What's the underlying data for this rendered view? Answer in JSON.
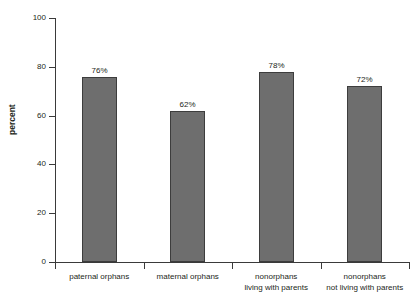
{
  "chart_data": {
    "type": "bar",
    "title": "",
    "xlabel": "",
    "ylabel": "percent",
    "ylim": [
      0,
      100
    ],
    "yticks": [
      0,
      20,
      40,
      60,
      80,
      100
    ],
    "grid": false,
    "legend": null,
    "bar_color": "#6e6e6e",
    "bar_border_color": "#3d3d3d",
    "axis_color": "#3a3a3a",
    "categories": [
      "paternal orphans",
      "maternal orphans",
      "nonorphans living with parents",
      "nonorphans not living with parents"
    ],
    "category_lines": [
      [
        "paternal orphans"
      ],
      [
        "maternal orphans"
      ],
      [
        "nonorphans",
        "living with parents"
      ],
      [
        "nonorphans",
        "not living with parents"
      ]
    ],
    "values": [
      76,
      62,
      78,
      72
    ],
    "data_labels": [
      "76%",
      "62%",
      "78%",
      "72%"
    ]
  },
  "axis": {
    "y_tick_labels": [
      "100",
      "80",
      "60",
      "40",
      "20",
      "0"
    ],
    "y_axis_title": "percent"
  }
}
